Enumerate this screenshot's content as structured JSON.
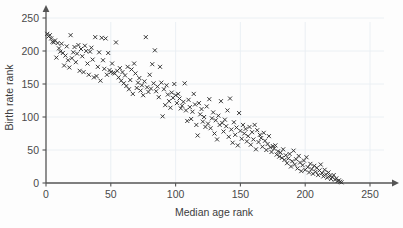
{
  "chart_data": {
    "type": "scatter",
    "title": "",
    "xlabel": "Median age rank",
    "ylabel": "Birth rate rank",
    "xlim": [
      0,
      258
    ],
    "ylim": [
      0,
      262
    ],
    "xticks": [
      0,
      50,
      100,
      150,
      200,
      250
    ],
    "yticks": [
      0,
      50,
      100,
      150,
      200,
      250
    ],
    "xtick_labels": [
      "0",
      "50",
      "100",
      "150",
      "200",
      "250"
    ],
    "ytick_labels": [
      "0",
      "50",
      "100",
      "150",
      "200",
      "250"
    ],
    "grid": true,
    "legend": false,
    "marker": "x",
    "marker_color": "#2e2e2e",
    "grid_color": "#e9eef3",
    "axis_color": "#555555",
    "background_color": "#fdfdfd",
    "correlation": "strong negative",
    "points": [
      [
        1,
        226
      ],
      [
        2,
        222
      ],
      [
        3,
        224
      ],
      [
        4,
        219
      ],
      [
        5,
        214
      ],
      [
        6,
        213
      ],
      [
        7,
        216
      ],
      [
        8,
        190
      ],
      [
        9,
        212
      ],
      [
        10,
        204
      ],
      [
        11,
        199
      ],
      [
        12,
        211
      ],
      [
        13,
        197
      ],
      [
        14,
        178
      ],
      [
        15,
        193
      ],
      [
        16,
        207
      ],
      [
        17,
        186
      ],
      [
        18,
        175
      ],
      [
        19,
        224
      ],
      [
        20,
        189
      ],
      [
        21,
        198
      ],
      [
        22,
        206
      ],
      [
        23,
        183
      ],
      [
        24,
        196
      ],
      [
        25,
        209
      ],
      [
        26,
        170
      ],
      [
        27,
        203
      ],
      [
        28,
        192
      ],
      [
        29,
        168
      ],
      [
        30,
        208
      ],
      [
        31,
        200
      ],
      [
        32,
        181
      ],
      [
        33,
        164
      ],
      [
        34,
        199
      ],
      [
        35,
        205
      ],
      [
        36,
        187
      ],
      [
        37,
        160
      ],
      [
        38,
        221
      ],
      [
        39,
        162
      ],
      [
        40,
        176
      ],
      [
        41,
        198
      ],
      [
        42,
        155
      ],
      [
        43,
        220
      ],
      [
        44,
        186
      ],
      [
        45,
        173
      ],
      [
        46,
        219
      ],
      [
        47,
        164
      ],
      [
        48,
        197
      ],
      [
        49,
        171
      ],
      [
        50,
        168
      ],
      [
        51,
        181
      ],
      [
        52,
        167
      ],
      [
        53,
        166
      ],
      [
        54,
        213
      ],
      [
        55,
        170
      ],
      [
        56,
        160
      ],
      [
        57,
        174
      ],
      [
        58,
        155
      ],
      [
        59,
        168
      ],
      [
        60,
        151
      ],
      [
        61,
        163
      ],
      [
        62,
        147
      ],
      [
        63,
        176
      ],
      [
        64,
        142
      ],
      [
        65,
        156
      ],
      [
        66,
        172
      ],
      [
        67,
        135
      ],
      [
        68,
        181
      ],
      [
        69,
        166
      ],
      [
        70,
        144
      ],
      [
        71,
        152
      ],
      [
        72,
        159
      ],
      [
        73,
        140
      ],
      [
        74,
        148
      ],
      [
        75,
        133
      ],
      [
        76,
        154
      ],
      [
        77,
        221
      ],
      [
        78,
        145
      ],
      [
        79,
        138
      ],
      [
        80,
        164
      ],
      [
        81,
        143
      ],
      [
        82,
        180
      ],
      [
        83,
        151
      ],
      [
        84,
        201
      ],
      [
        85,
        139
      ],
      [
        86,
        146
      ],
      [
        87,
        130
      ],
      [
        88,
        176
      ],
      [
        89,
        152
      ],
      [
        90,
        101
      ],
      [
        91,
        142
      ],
      [
        92,
        118
      ],
      [
        93,
        148
      ],
      [
        94,
        134
      ],
      [
        95,
        124
      ],
      [
        96,
        114
      ],
      [
        97,
        137
      ],
      [
        98,
        129
      ],
      [
        99,
        150
      ],
      [
        100,
        133
      ],
      [
        101,
        121
      ],
      [
        102,
        135
      ],
      [
        103,
        128
      ],
      [
        104,
        113
      ],
      [
        105,
        117
      ],
      [
        106,
        123
      ],
      [
        107,
        151
      ],
      [
        108,
        110
      ],
      [
        109,
        94
      ],
      [
        110,
        126
      ],
      [
        111,
        115
      ],
      [
        112,
        97
      ],
      [
        113,
        108
      ],
      [
        114,
        135
      ],
      [
        115,
        119
      ],
      [
        116,
        88
      ],
      [
        117,
        72
      ],
      [
        118,
        121
      ],
      [
        119,
        104
      ],
      [
        120,
        112
      ],
      [
        121,
        93
      ],
      [
        122,
        100
      ],
      [
        123,
        85
      ],
      [
        124,
        116
      ],
      [
        125,
        90
      ],
      [
        126,
        127
      ],
      [
        127,
        83
      ],
      [
        128,
        98
      ],
      [
        129,
        107
      ],
      [
        130,
        75
      ],
      [
        131,
        95
      ],
      [
        132,
        66
      ],
      [
        133,
        102
      ],
      [
        134,
        88
      ],
      [
        135,
        124
      ],
      [
        136,
        91
      ],
      [
        137,
        78
      ],
      [
        138,
        96
      ],
      [
        139,
        86
      ],
      [
        140,
        110
      ],
      [
        141,
        70
      ],
      [
        142,
        128
      ],
      [
        143,
        81
      ],
      [
        144,
        61
      ],
      [
        145,
        92
      ],
      [
        146,
        73
      ],
      [
        147,
        84
      ],
      [
        148,
        57
      ],
      [
        149,
        106
      ],
      [
        150,
        79
      ],
      [
        151,
        67
      ],
      [
        152,
        88
      ],
      [
        153,
        75
      ],
      [
        154,
        82
      ],
      [
        155,
        63
      ],
      [
        156,
        71
      ],
      [
        157,
        85
      ],
      [
        158,
        58
      ],
      [
        159,
        77
      ],
      [
        160,
        66
      ],
      [
        161,
        88
      ],
      [
        162,
        51
      ],
      [
        163,
        80
      ],
      [
        164,
        62
      ],
      [
        165,
        73
      ],
      [
        166,
        68
      ],
      [
        167,
        55
      ],
      [
        168,
        76
      ],
      [
        169,
        64
      ],
      [
        170,
        50
      ],
      [
        171,
        59
      ],
      [
        172,
        71
      ],
      [
        173,
        54
      ],
      [
        174,
        47
      ],
      [
        175,
        56
      ],
      [
        176,
        52
      ],
      [
        177,
        57
      ],
      [
        178,
        43
      ],
      [
        179,
        48
      ],
      [
        180,
        40
      ],
      [
        181,
        46
      ],
      [
        182,
        38
      ],
      [
        183,
        51
      ],
      [
        184,
        35
      ],
      [
        185,
        42
      ],
      [
        186,
        30
      ],
      [
        187,
        37
      ],
      [
        188,
        44
      ],
      [
        189,
        25
      ],
      [
        190,
        33
      ],
      [
        191,
        49
      ],
      [
        192,
        28
      ],
      [
        193,
        36
      ],
      [
        194,
        22
      ],
      [
        195,
        41
      ],
      [
        196,
        31
      ],
      [
        197,
        18
      ],
      [
        198,
        27
      ],
      [
        199,
        34
      ],
      [
        200,
        20
      ],
      [
        201,
        39
      ],
      [
        202,
        24
      ],
      [
        203,
        16
      ],
      [
        204,
        29
      ],
      [
        205,
        21
      ],
      [
        206,
        14
      ],
      [
        207,
        26
      ],
      [
        208,
        17
      ],
      [
        209,
        23
      ],
      [
        210,
        12
      ],
      [
        211,
        19
      ],
      [
        212,
        28
      ],
      [
        213,
        15
      ],
      [
        214,
        10
      ],
      [
        215,
        20
      ],
      [
        216,
        13
      ],
      [
        217,
        8
      ],
      [
        218,
        16
      ],
      [
        219,
        11
      ],
      [
        220,
        6
      ],
      [
        221,
        9
      ],
      [
        222,
        12
      ],
      [
        223,
        5
      ],
      [
        224,
        7
      ],
      [
        225,
        3
      ],
      [
        226,
        4
      ],
      [
        227,
        2
      ],
      [
        228,
        1
      ]
    ]
  }
}
